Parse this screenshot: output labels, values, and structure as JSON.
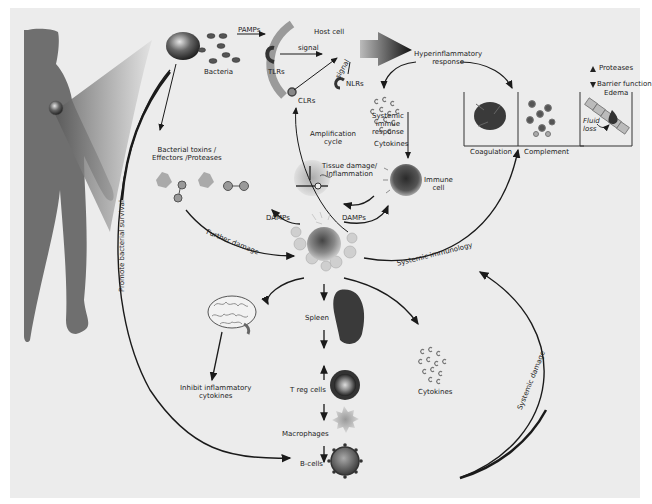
{
  "labels": {
    "pamps": "PAMPs",
    "host_cell": "Host cell",
    "bacteria": "Bacteria",
    "tlrs": "TLRs",
    "signal_1": "signal",
    "signal_2": "signal",
    "nlrs": "NLRs",
    "clrs": "CLRs",
    "hyperinflammatory_1": "Hyperinflammatory",
    "hyperinflammatory_2": "response",
    "proteases_up": "Proteases",
    "barrier_function": "Barrier function",
    "edema": "Edema",
    "fluid": "Fluid",
    "loss": "loss",
    "cytokines_top": "Cytokines",
    "coagulation": "Coagulation",
    "complement": "Complement",
    "systemic_1": "Systemic",
    "systemic_2": "immue",
    "systemic_3": "response",
    "amplification_1": "Amplification",
    "amplification_2": "cycle",
    "tissue_1": "Tissue damage/",
    "tissue_2": "Inflammation",
    "immune_1": "Immune",
    "immune_2": "cell",
    "toxins_1": "Bacterial toxins /",
    "toxins_2": "Effectors /Proteases",
    "damps_left": "DAMPs",
    "damps_right": "DAMPs",
    "further_damage": "Further damage",
    "systemic_immunology": "Systemic immunology",
    "promote_survival": "Promote bacterial survival",
    "spleen": "Spleen",
    "inhibit_1": "Inhibit inflammatory",
    "inhibit_2": "cytokines",
    "treg": "T reg cells",
    "macrophages": "Macrophages",
    "bcells": "B-cells",
    "cytokines_bottom": "Cytokines",
    "systemic_damage": "Systemic damage"
  },
  "colors": {
    "background": "#ececec",
    "arrow": "#1a1a1a",
    "silhouette": "#6f6f6f",
    "cell_dark": "#3a3a3a"
  }
}
